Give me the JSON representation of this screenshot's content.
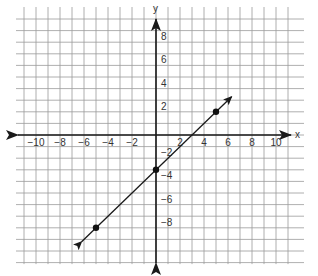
{
  "chart_data": {
    "type": "line",
    "title": "",
    "xlabel": "x",
    "ylabel": "y",
    "xlim": [
      -11,
      11
    ],
    "ylim": [
      -11,
      10
    ],
    "grid": true,
    "x_ticks": [
      -10,
      -8,
      -6,
      -4,
      -2,
      2,
      4,
      6,
      8,
      10
    ],
    "y_ticks": [
      8,
      6,
      4,
      2,
      -2,
      -4,
      -6,
      -8
    ],
    "x_tick_labels": [
      "−10",
      "−8",
      "−6",
      "−4",
      "−2",
      "2",
      "4",
      "6",
      "8",
      "10"
    ],
    "y_tick_labels": [
      "8",
      "6",
      "4",
      "2",
      "−2",
      "−4",
      "−6",
      "−8"
    ],
    "series": [
      {
        "name": "line",
        "equation": "y = x - 3",
        "slope": 1,
        "intercept": -3,
        "points": [
          {
            "x": -5,
            "y": -8
          },
          {
            "x": 0,
            "y": -3
          },
          {
            "x": 5,
            "y": 2
          }
        ],
        "arrow_start": {
          "x": -6.2,
          "y": -9.2
        },
        "arrow_end": {
          "x": 6.3,
          "y": 3.3
        }
      }
    ]
  },
  "axes": {
    "x_label": "x",
    "y_label": "y"
  }
}
